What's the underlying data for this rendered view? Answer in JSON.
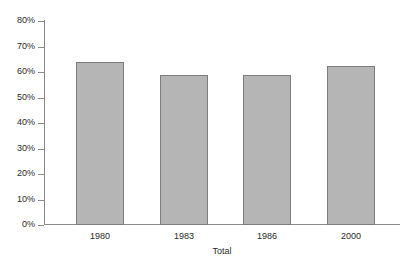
{
  "chart_data": {
    "type": "bar",
    "title": "",
    "subtitle": "",
    "categories": [
      "1980",
      "1983",
      "1986",
      "2000"
    ],
    "values": [
      64,
      59,
      59,
      62.5
    ],
    "xlabel": "Total",
    "ylabel": "",
    "ylim": [
      0,
      80
    ],
    "ytick_values": [
      0,
      10,
      20,
      30,
      40,
      50,
      60,
      70,
      80
    ],
    "ytick_labels": [
      "0%",
      "10%",
      "20%",
      "30%",
      "40%",
      "50%",
      "60%",
      "70%",
      "80%"
    ],
    "grid": false,
    "legend": null,
    "bar_fill_color": "#b5b5b5",
    "bar_border_color": "#7d7d7d",
    "axis_color": "#8a8a8a",
    "background_color": "#ffffff"
  }
}
